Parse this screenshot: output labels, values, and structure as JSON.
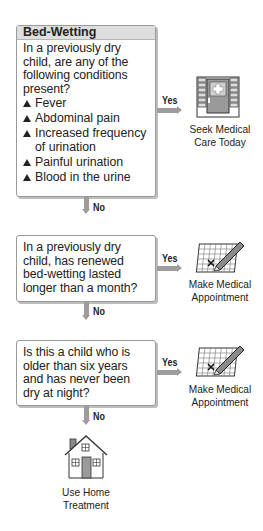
{
  "title": "Bed-Wetting",
  "steps": [
    {
      "question": [
        "In a previously dry",
        "child, are any of the",
        "following conditions",
        "present?"
      ],
      "conditions": [
        "Fever",
        "Abdominal pain",
        "Increased frequency of urination",
        "Painful urination",
        "Blood in the urine"
      ],
      "yes_label": "Yes",
      "no_label": "No",
      "yes_outcome": [
        "Seek Medical",
        "Care Today"
      ],
      "yes_icon": "hospital-door-icon"
    },
    {
      "question": [
        "In a previously dry",
        "child, has renewed",
        "bed-wetting lasted",
        "longer than a month?"
      ],
      "yes_label": "Yes",
      "no_label": "No",
      "yes_outcome": [
        "Make Medical",
        "Appointment"
      ],
      "yes_icon": "calendar-pencil-icon"
    },
    {
      "question": [
        "Is this a child who is",
        "older than six years",
        "and has never been",
        "dry at night?"
      ],
      "yes_label": "Yes",
      "no_label": "No",
      "yes_outcome": [
        "Make Medical",
        "Appointment"
      ],
      "yes_icon": "calendar-pencil-icon"
    }
  ],
  "final_outcome": {
    "label": [
      "Use Home",
      "Treatment"
    ],
    "icon": "house-icon"
  },
  "colors": {
    "arrow": "#9d9d9d",
    "header_bg": "#dedede",
    "border": "#9a9a9a"
  }
}
